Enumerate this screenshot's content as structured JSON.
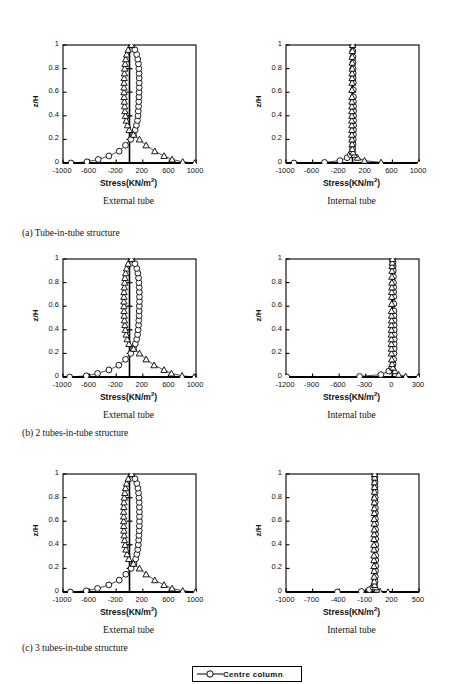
{
  "figure": {
    "axis_label_y": "z/H",
    "axis_label_x": "Stress(KN/m",
    "axis_label_x_sup": "2",
    "axis_label_x_tail": ")",
    "subcaption_external": "External tube",
    "subcaption_internal": "Internal tube",
    "captions": [
      "(a) Tube-in-tube structure",
      "(b) 2 tubes-in-tube structure",
      "(c) 3 tubes-in-tube structure"
    ],
    "legend": {
      "label": "Centre column",
      "marker": "circle-marker"
    }
  },
  "chart_data": [
    {
      "id": "a-external",
      "type": "line",
      "title": "External tube",
      "group": "(a) Tube-in-tube structure",
      "xlabel": "Stress(KN/m2)",
      "ylabel": "z/H",
      "xlim": [
        -1000,
        1000
      ],
      "ylim": [
        0,
        1
      ],
      "xticks": [
        -1000,
        -600,
        -200,
        200,
        600,
        1000
      ],
      "yticks": [
        0,
        0.2,
        0.4,
        0.6,
        0.8,
        1
      ],
      "grid": false,
      "legend_position": "below-figure",
      "series": [
        {
          "name": "Centre column",
          "marker": "circle",
          "x": [
            -880,
            -640,
            -470,
            -310,
            -155,
            -60,
            20,
            60,
            85,
            105,
            120,
            128,
            132,
            136,
            140,
            142,
            144,
            146,
            146,
            146,
            144,
            140,
            134,
            124,
            108,
            80,
            30
          ],
          "y": [
            0.0,
            0.01,
            0.03,
            0.06,
            0.1,
            0.15,
            0.2,
            0.24,
            0.28,
            0.32,
            0.36,
            0.4,
            0.44,
            0.48,
            0.52,
            0.56,
            0.6,
            0.64,
            0.68,
            0.72,
            0.76,
            0.8,
            0.84,
            0.88,
            0.92,
            0.96,
            1.0
          ]
        },
        {
          "name": "Tube column",
          "marker": "triangle",
          "x": [
            980,
            800,
            640,
            520,
            380,
            250,
            150,
            60,
            -5,
            -30,
            -48,
            -60,
            -68,
            -74,
            -78,
            -80,
            -82,
            -82,
            -82,
            -80,
            -76,
            -72,
            -66,
            -56,
            -42,
            -20,
            30
          ],
          "y": [
            0.0,
            0.01,
            0.03,
            0.06,
            0.1,
            0.15,
            0.2,
            0.24,
            0.28,
            0.32,
            0.36,
            0.4,
            0.44,
            0.48,
            0.52,
            0.56,
            0.6,
            0.64,
            0.68,
            0.72,
            0.76,
            0.8,
            0.84,
            0.88,
            0.92,
            0.96,
            1.0
          ]
        }
      ]
    },
    {
      "id": "a-internal",
      "type": "line",
      "title": "Internal tube",
      "group": "(a) Tube-in-tube structure",
      "xlabel": "Stress(KN/m2)",
      "ylabel": "z/H",
      "xlim": [
        -1000,
        1000
      ],
      "ylim": [
        0,
        1
      ],
      "xticks": [
        -1000,
        -600,
        -200,
        200,
        600,
        1000
      ],
      "yticks": [
        0,
        0.2,
        0.4,
        0.6,
        0.8,
        1
      ],
      "grid": false,
      "legend_position": "below-figure",
      "series": [
        {
          "name": "Centre column",
          "marker": "circle",
          "x": [
            -880,
            -420,
            -190,
            -80,
            -30,
            -8,
            2,
            8,
            12,
            14,
            16,
            16,
            16,
            16,
            16,
            16,
            14,
            14,
            12,
            12,
            10,
            10,
            8,
            8,
            6,
            4,
            2
          ],
          "y": [
            0.0,
            0.005,
            0.02,
            0.045,
            0.07,
            0.09,
            0.12,
            0.16,
            0.2,
            0.24,
            0.28,
            0.32,
            0.36,
            0.4,
            0.44,
            0.48,
            0.52,
            0.56,
            0.62,
            0.68,
            0.72,
            0.76,
            0.8,
            0.85,
            0.9,
            0.95,
            1.0
          ]
        },
        {
          "name": "Tube column",
          "marker": "triangle",
          "x": [
            1000,
            430,
            180,
            75,
            28,
            8,
            -2,
            -6,
            -8,
            -10,
            -10,
            -10,
            -10,
            -10,
            -10,
            -10,
            -8,
            -8,
            -8,
            -6,
            -6,
            -6,
            -4,
            -4,
            -4,
            -2,
            2
          ],
          "y": [
            0.0,
            0.005,
            0.02,
            0.045,
            0.07,
            0.09,
            0.12,
            0.16,
            0.2,
            0.24,
            0.28,
            0.32,
            0.36,
            0.4,
            0.44,
            0.48,
            0.52,
            0.56,
            0.62,
            0.68,
            0.72,
            0.76,
            0.8,
            0.85,
            0.9,
            0.95,
            1.0
          ]
        }
      ]
    },
    {
      "id": "b-external",
      "type": "line",
      "title": "External tube",
      "group": "(b) 2 tubes-in-tube structure",
      "xlabel": "Stress(KN/m2)",
      "ylabel": "z/H",
      "xlim": [
        -1000,
        1000
      ],
      "ylim": [
        0,
        1
      ],
      "xticks": [
        -1000,
        -600,
        -200,
        200,
        600,
        1000
      ],
      "yticks": [
        0,
        0.2,
        0.4,
        0.6,
        0.8,
        1
      ],
      "grid": false,
      "legend_position": "below-figure",
      "series": [
        {
          "name": "Centre column",
          "marker": "circle",
          "x": [
            -900,
            -650,
            -480,
            -310,
            -160,
            -60,
            20,
            62,
            88,
            108,
            122,
            130,
            136,
            140,
            144,
            146,
            148,
            150,
            150,
            148,
            146,
            142,
            136,
            126,
            110,
            82,
            30
          ],
          "y": [
            0.0,
            0.01,
            0.03,
            0.06,
            0.1,
            0.15,
            0.2,
            0.24,
            0.28,
            0.32,
            0.36,
            0.4,
            0.44,
            0.48,
            0.52,
            0.56,
            0.6,
            0.64,
            0.68,
            0.72,
            0.76,
            0.8,
            0.84,
            0.88,
            0.92,
            0.96,
            1.0
          ]
        },
        {
          "name": "Tube column",
          "marker": "triangle",
          "x": [
            970,
            790,
            630,
            520,
            370,
            250,
            150,
            60,
            -8,
            -34,
            -50,
            -62,
            -70,
            -76,
            -80,
            -82,
            -84,
            -84,
            -84,
            -82,
            -78,
            -74,
            -68,
            -58,
            -44,
            -20,
            30
          ],
          "y": [
            0.0,
            0.01,
            0.03,
            0.06,
            0.1,
            0.15,
            0.2,
            0.24,
            0.28,
            0.32,
            0.36,
            0.4,
            0.44,
            0.48,
            0.52,
            0.56,
            0.6,
            0.64,
            0.68,
            0.72,
            0.76,
            0.8,
            0.84,
            0.88,
            0.92,
            0.96,
            1.0
          ]
        }
      ]
    },
    {
      "id": "b-internal",
      "type": "line",
      "title": "Internal tube",
      "group": "(b) 2 tubes-in-tube structure",
      "xlabel": "Stress(KN/m2)",
      "ylabel": "z/H",
      "xlim": [
        -1200,
        300
      ],
      "ylim": [
        0,
        1
      ],
      "xticks": [
        -1200,
        -900,
        -600,
        -300,
        0,
        300
      ],
      "yticks": [
        0,
        0.2,
        0.4,
        0.6,
        0.8,
        1
      ],
      "grid": false,
      "legend_position": "below-figure",
      "series": [
        {
          "name": "Centre column",
          "marker": "circle",
          "x": [
            -1190,
            -370,
            -130,
            -40,
            -6,
            8,
            14,
            18,
            20,
            20,
            20,
            20,
            20,
            20,
            18,
            18,
            18,
            16,
            16,
            14,
            14,
            12,
            12,
            10,
            8,
            6,
            2
          ],
          "y": [
            0.0,
            0.005,
            0.02,
            0.05,
            0.08,
            0.11,
            0.15,
            0.2,
            0.24,
            0.28,
            0.32,
            0.36,
            0.4,
            0.44,
            0.48,
            0.52,
            0.56,
            0.62,
            0.68,
            0.72,
            0.76,
            0.8,
            0.85,
            0.9,
            0.94,
            0.97,
            1.0
          ]
        },
        {
          "name": "Tube column",
          "marker": "triangle",
          "x": [
            290,
            150,
            70,
            28,
            6,
            -4,
            -8,
            -10,
            -12,
            -12,
            -12,
            -12,
            -12,
            -12,
            -10,
            -10,
            -10,
            -8,
            -8,
            -8,
            -6,
            -6,
            -6,
            -4,
            -4,
            -2,
            2
          ],
          "y": [
            0.0,
            0.005,
            0.02,
            0.05,
            0.08,
            0.11,
            0.15,
            0.2,
            0.24,
            0.28,
            0.32,
            0.36,
            0.4,
            0.44,
            0.48,
            0.52,
            0.56,
            0.62,
            0.68,
            0.72,
            0.76,
            0.8,
            0.85,
            0.9,
            0.94,
            0.97,
            1.0
          ]
        }
      ]
    },
    {
      "id": "c-external",
      "type": "line",
      "title": "External tube",
      "group": "(c) 3 tubes-in-tube structure",
      "xlabel": "Stress(KN/m2)",
      "ylabel": "z/H",
      "xlim": [
        -1000,
        1000
      ],
      "ylim": [
        0,
        1
      ],
      "xticks": [
        -1000,
        -600,
        -200,
        200,
        600,
        1000
      ],
      "yticks": [
        0,
        0.2,
        0.4,
        0.6,
        0.8,
        1
      ],
      "grid": false,
      "legend_position": "below-figure",
      "series": [
        {
          "name": "Centre column",
          "marker": "circle",
          "x": [
            -890,
            -650,
            -480,
            -310,
            -155,
            -55,
            25,
            66,
            92,
            110,
            124,
            132,
            138,
            142,
            146,
            148,
            150,
            150,
            150,
            148,
            146,
            142,
            136,
            126,
            110,
            82,
            30
          ],
          "y": [
            0.0,
            0.01,
            0.03,
            0.06,
            0.1,
            0.15,
            0.2,
            0.24,
            0.28,
            0.32,
            0.36,
            0.4,
            0.44,
            0.48,
            0.52,
            0.56,
            0.6,
            0.64,
            0.68,
            0.72,
            0.76,
            0.8,
            0.84,
            0.88,
            0.92,
            0.96,
            1.0
          ]
        },
        {
          "name": "Tube column",
          "marker": "triangle",
          "x": [
            990,
            800,
            640,
            520,
            380,
            250,
            150,
            58,
            -10,
            -36,
            -54,
            -66,
            -74,
            -80,
            -84,
            -86,
            -88,
            -88,
            -88,
            -86,
            -82,
            -78,
            -70,
            -60,
            -44,
            -20,
            30
          ],
          "y": [
            0.0,
            0.01,
            0.03,
            0.06,
            0.1,
            0.15,
            0.2,
            0.24,
            0.28,
            0.32,
            0.36,
            0.4,
            0.44,
            0.48,
            0.52,
            0.56,
            0.6,
            0.64,
            0.68,
            0.72,
            0.76,
            0.8,
            0.84,
            0.88,
            0.92,
            0.96,
            1.0
          ]
        }
      ]
    },
    {
      "id": "c-internal",
      "type": "line",
      "title": "Internal tube",
      "group": "(c) 3 tubes-in-tube structure",
      "xlabel": "Stress(KN/m2)",
      "ylabel": "z/H",
      "xlim": [
        -1000,
        500
      ],
      "ylim": [
        0,
        1
      ],
      "xticks": [
        -1000,
        -700,
        -400,
        -100,
        200,
        500
      ],
      "yticks": [
        0,
        0.2,
        0.4,
        0.6,
        0.8,
        1
      ],
      "grid": false,
      "legend_position": "below-figure",
      "series": [
        {
          "name": "Centre column",
          "marker": "circle",
          "x": [
            -420,
            -150,
            -60,
            -20,
            -4,
            4,
            8,
            10,
            12,
            12,
            12,
            12,
            12,
            12,
            10,
            10,
            10,
            8,
            8,
            8,
            6,
            6,
            6,
            4,
            4,
            2,
            0
          ],
          "y": [
            0.0,
            0.005,
            0.02,
            0.04,
            0.06,
            0.09,
            0.13,
            0.18,
            0.22,
            0.27,
            0.31,
            0.36,
            0.4,
            0.45,
            0.49,
            0.53,
            0.58,
            0.62,
            0.67,
            0.71,
            0.76,
            0.8,
            0.85,
            0.89,
            0.93,
            0.97,
            1.0
          ]
        },
        {
          "name": "Tube column",
          "marker": "triangle",
          "x": [
            150,
            60,
            24,
            8,
            0,
            -4,
            -6,
            -6,
            -8,
            -8,
            -8,
            -8,
            -8,
            -8,
            -6,
            -6,
            -6,
            -6,
            -4,
            -4,
            -4,
            -4,
            -2,
            -2,
            -2,
            0,
            0
          ],
          "y": [
            0.0,
            0.005,
            0.02,
            0.04,
            0.06,
            0.09,
            0.13,
            0.18,
            0.22,
            0.27,
            0.31,
            0.36,
            0.4,
            0.45,
            0.49,
            0.53,
            0.58,
            0.62,
            0.67,
            0.71,
            0.76,
            0.8,
            0.85,
            0.89,
            0.93,
            0.97,
            1.0
          ]
        }
      ]
    }
  ]
}
